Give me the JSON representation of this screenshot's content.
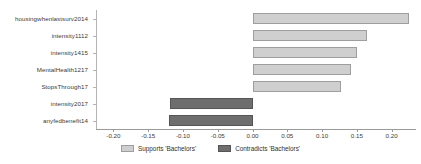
{
  "chart_data": {
    "type": "bar",
    "orientation": "horizontal",
    "title": "",
    "xlabel": "",
    "ylabel": "",
    "xlim": [
      -0.225,
      0.235
    ],
    "xticks": [
      "-0.20",
      "-0.15",
      "-0.10",
      "-0.05",
      "0.00",
      "0.05",
      "0.10",
      "0.15",
      "0.20"
    ],
    "xtick_values": [
      -0.2,
      -0.15,
      -0.1,
      -0.05,
      0.0,
      0.05,
      0.1,
      0.15,
      0.2
    ],
    "grid": false,
    "legend_position": "bottom-center",
    "categories": [
      "housingwhenlastsurv2014",
      "intensity1112",
      "intensity1415",
      "MentalHealth1217",
      "StopsThrough17",
      "intensity2017",
      "anyfedbenefit14"
    ],
    "values": [
      0.225,
      0.165,
      0.15,
      0.142,
      0.127,
      -0.118,
      -0.12
    ],
    "bar_groups": [
      "Supports 'Bachelors'",
      "Supports 'Bachelors'",
      "Supports 'Bachelors'",
      "Supports 'Bachelors'",
      "Supports 'Bachelors'",
      "Contradicts 'Bachelors'",
      "Contradicts 'Bachelors'"
    ],
    "legend": [
      {
        "label": "Supports 'Bachelors'",
        "color": "#cfcfcf"
      },
      {
        "label": "Contradicts 'Bachelors'",
        "color": "#6e6e6e"
      }
    ],
    "colors": {
      "supports": "#cfcfcf",
      "contradicts": "#6e6e6e",
      "supports_edge": "#9e9e9e",
      "contradicts_edge": "#555555",
      "axis": "#9a9a9a",
      "text": "#3b3b3b",
      "background": "#ffffff"
    }
  }
}
